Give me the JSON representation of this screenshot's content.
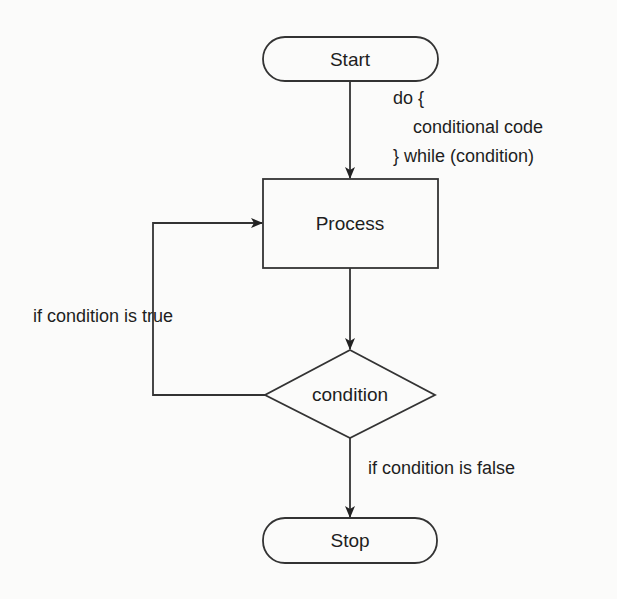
{
  "diagram": {
    "type": "flowchart",
    "nodes": {
      "start": {
        "label": "Start",
        "shape": "terminator"
      },
      "process": {
        "label": "Process",
        "shape": "rectangle"
      },
      "condition": {
        "label": "condition",
        "shape": "diamond"
      },
      "stop": {
        "label": "Stop",
        "shape": "terminator"
      }
    },
    "annotations": {
      "code_line1": "do {",
      "code_line2": "conditional code",
      "code_line3": "} while (condition)",
      "true_branch": "if condition is true",
      "false_branch": "if condition is false"
    },
    "edges": [
      {
        "from": "start",
        "to": "process",
        "label": ""
      },
      {
        "from": "process",
        "to": "condition",
        "label": ""
      },
      {
        "from": "condition",
        "to": "process",
        "label": "if condition is true"
      },
      {
        "from": "condition",
        "to": "stop",
        "label": "if condition is false"
      }
    ],
    "colors": {
      "background": "#fbfbfa",
      "stroke": "#333333",
      "text": "#1e1e1e"
    }
  }
}
